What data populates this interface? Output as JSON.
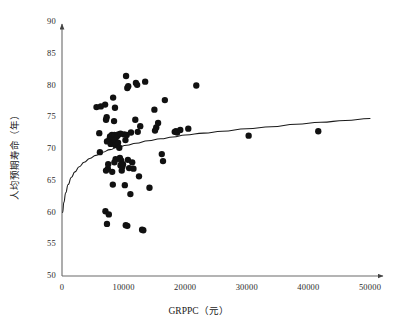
{
  "chart_data": {
    "type": "scatter",
    "title": "",
    "xlabel": "GRPPC（元）",
    "ylabel": "人均预期寿命（年）",
    "xlim": [
      0,
      50000
    ],
    "ylim": [
      50,
      90
    ],
    "grid": false,
    "legend": "none",
    "x_ticks": [
      "0",
      "10000",
      "20000",
      "30000",
      "40000",
      "50000"
    ],
    "x_tick_values": [
      0,
      10000,
      20000,
      30000,
      40000,
      50000
    ],
    "y_ticks": [
      "50",
      "55",
      "60",
      "65",
      "70",
      "75",
      "80",
      "85",
      "90"
    ],
    "y_tick_values": [
      50,
      55,
      60,
      65,
      70,
      75,
      80,
      85,
      90
    ],
    "marker": {
      "shape": "circle",
      "color": "#111111",
      "size": 4.6
    },
    "series": [
      {
        "name": "省级观测值",
        "points": [
          [
            5600,
            76.6
          ],
          [
            6300,
            76.7
          ],
          [
            6050,
            72.5
          ],
          [
            6150,
            69.5
          ],
          [
            7000,
            77.0
          ],
          [
            7150,
            74.6
          ],
          [
            7250,
            75.0
          ],
          [
            7300,
            71.2
          ],
          [
            7450,
            66.9
          ],
          [
            7500,
            67.6
          ],
          [
            7150,
            66.6
          ],
          [
            7050,
            60.2
          ],
          [
            7300,
            58.2
          ],
          [
            7600,
            59.7
          ],
          [
            7700,
            71.5
          ],
          [
            7800,
            72.0
          ],
          [
            7900,
            70.8
          ],
          [
            8000,
            71.6
          ],
          [
            8100,
            72.2
          ],
          [
            8200,
            70.9
          ],
          [
            8300,
            71.1
          ],
          [
            8400,
            71.8
          ],
          [
            8500,
            72.2
          ],
          [
            8600,
            71.3
          ],
          [
            8700,
            70.6
          ],
          [
            8800,
            71.9
          ],
          [
            8300,
            78.1
          ],
          [
            8600,
            76.5
          ],
          [
            8450,
            74.4
          ],
          [
            8500,
            67.9
          ],
          [
            8700,
            68.4
          ],
          [
            8150,
            66.4
          ],
          [
            8250,
            64.4
          ],
          [
            9000,
            72.1
          ],
          [
            9100,
            71.0
          ],
          [
            9150,
            72.3
          ],
          [
            9300,
            70.2
          ],
          [
            9400,
            68.6
          ],
          [
            9500,
            67.4
          ],
          [
            9600,
            68.2
          ],
          [
            9700,
            66.6
          ],
          [
            9800,
            67.2
          ],
          [
            9900,
            67.6
          ],
          [
            9500,
            72.4
          ],
          [
            10100,
            72.3
          ],
          [
            10300,
            71.4
          ],
          [
            10500,
            72.2
          ],
          [
            10700,
            68.3
          ],
          [
            10900,
            67.0
          ],
          [
            10400,
            81.5
          ],
          [
            10600,
            79.6
          ],
          [
            10750,
            79.9
          ],
          [
            10200,
            64.3
          ],
          [
            10350,
            58.0
          ],
          [
            10600,
            57.9
          ],
          [
            11200,
            72.6
          ],
          [
            11400,
            67.9
          ],
          [
            11600,
            66.9
          ],
          [
            11100,
            62.9
          ],
          [
            12000,
            80.4
          ],
          [
            12200,
            80.1
          ],
          [
            11900,
            74.6
          ],
          [
            12300,
            72.7
          ],
          [
            12700,
            73.6
          ],
          [
            12500,
            65.7
          ],
          [
            13500,
            80.6
          ],
          [
            13000,
            57.3
          ],
          [
            13200,
            57.2
          ],
          [
            14200,
            63.9
          ],
          [
            15000,
            76.2
          ],
          [
            15300,
            73.4
          ],
          [
            15600,
            74.1
          ],
          [
            15100,
            72.9
          ],
          [
            16200,
            69.2
          ],
          [
            16400,
            68.1
          ],
          [
            16700,
            77.7
          ],
          [
            18300,
            72.7
          ],
          [
            18500,
            72.8
          ],
          [
            18700,
            72.6
          ],
          [
            19200,
            73.0
          ],
          [
            20500,
            73.2
          ],
          [
            21800,
            80.0
          ],
          [
            30300,
            72.1
          ],
          [
            41600,
            72.8
          ]
        ]
      }
    ],
    "fit_curve": {
      "name": "对数拟合曲线",
      "type": "logarithmic",
      "color": "#1a1a1a",
      "points": [
        [
          100,
          60.0
        ],
        [
          300,
          61.6
        ],
        [
          600,
          63.1
        ],
        [
          1000,
          64.4
        ],
        [
          1500,
          65.5
        ],
        [
          2100,
          66.4
        ],
        [
          2800,
          67.2
        ],
        [
          3600,
          67.9
        ],
        [
          4500,
          68.5
        ],
        [
          5500,
          69.0
        ],
        [
          6600,
          69.5
        ],
        [
          7800,
          69.9
        ],
        [
          9000,
          70.3
        ],
        [
          10500,
          70.6
        ],
        [
          12000,
          70.9
        ],
        [
          14000,
          71.3
        ],
        [
          16000,
          71.6
        ],
        [
          18000,
          71.9
        ],
        [
          20000,
          72.2
        ],
        [
          23000,
          72.5
        ],
        [
          26000,
          72.8
        ],
        [
          30000,
          73.2
        ],
        [
          34000,
          73.5
        ],
        [
          38000,
          73.9
        ],
        [
          42000,
          74.2
        ],
        [
          46000,
          74.5
        ],
        [
          50000,
          74.8
        ]
      ]
    }
  },
  "axes": {
    "x_title": "GRPPC（元）",
    "y_title": "人均预期寿命（年）",
    "x_labels": [
      "0",
      "10000",
      "20000",
      "30000",
      "40000",
      "50000"
    ],
    "y_labels": [
      "50",
      "55",
      "60",
      "65",
      "70",
      "75",
      "80",
      "85",
      "90"
    ]
  },
  "colors": {
    "axis": "#555555",
    "marker": "#111111",
    "curve": "#1a1a1a",
    "background": "#ffffff"
  }
}
